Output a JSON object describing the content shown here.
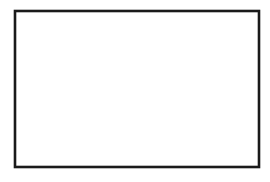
{
  "figure": {
    "kind": "line-drawing",
    "background_color": "#ffffff",
    "line_color": "#262626",
    "frame_color": "#1a1a1a",
    "frame": {
      "x": 15,
      "y": 11,
      "width": 244,
      "height": 156,
      "stroke_width": 2.6
    },
    "canvas": {
      "width": 270,
      "height": 182
    },
    "grain_count": 27,
    "caption": ""
  },
  "grains": [
    {
      "id": "grain-01",
      "label": "",
      "path": "M 16 14 C 30 12 46 13 58 18 C 70 23 74 34 66 44 C 58 54 40 58 28 54 C 20 51 16 44 16 36 Z"
    },
    {
      "id": "grain-02",
      "label": "",
      "path": "M 58 17 C 74 12 92 12 104 17 C 114 21 114 33 106 43 C 98 53 80 58 68 52 C 59 47 55 36 58 17 Z"
    },
    {
      "id": "grain-03",
      "label": "",
      "path": "M 106 13 C 122 12 140 13 150 19 C 158 24 158 37 150 47 C 142 57 124 58 114 52 C 104 46 100 30 106 13 Z"
    },
    {
      "id": "grain-04",
      "label": "",
      "path": "M 152 13 C 166 12 180 16 186 26 C 192 36 188 48 178 54 C 168 60 154 56 150 46 C 146 36 146 22 152 13 Z"
    },
    {
      "id": "grain-05",
      "label": "",
      "path": "M 186 14 C 198 12 206 22 204 36 C 202 50 192 58 184 54 C 176 50 176 34 180 24 C 182 18 184 15 186 14 Z"
    },
    {
      "id": "grain-06",
      "label": "",
      "path": "M 206 13 C 224 12 242 14 252 20 C 258 25 258 38 250 46 C 240 55 222 56 212 50 C 204 44 202 26 206 13 Z"
    },
    {
      "id": "grain-07",
      "label": "",
      "path": "M 16 52 C 28 48 44 50 52 58 C 60 66 58 80 48 88 C 38 96 22 96 16 90 Z"
    },
    {
      "id": "grain-08",
      "label": "",
      "path": "M 54 56 C 74 46 100 48 112 58 C 124 68 122 90 110 104 C 98 118 72 122 58 112 C 46 103 44 70 54 56 Z"
    },
    {
      "id": "grain-09",
      "label": "",
      "path": "M 114 54 C 138 44 166 48 178 62 C 190 76 188 104 174 118 C 160 132 130 134 118 120 C 106 106 104 66 114 54 Z"
    },
    {
      "id": "grain-10",
      "label": "",
      "path": "M 182 54 C 202 46 226 48 238 58 C 250 68 248 88 236 98 C 224 108 200 110 188 100 C 176 90 174 62 182 54 Z"
    },
    {
      "id": "grain-11",
      "label": "",
      "path": "M 240 50 C 250 48 258 54 258 64 C 258 74 250 82 242 80 C 234 78 232 60 240 50 Z"
    },
    {
      "id": "grain-12",
      "label": "",
      "path": "M 16 92 C 28 90 42 94 48 102 C 54 110 50 122 40 128 C 30 134 18 132 16 126 Z"
    },
    {
      "id": "grain-13",
      "label": "",
      "path": "M 50 92 C 62 88 76 92 82 102 C 88 112 84 126 74 132 C 64 138 52 134 48 124 C 44 114 44 98 50 92 Z"
    },
    {
      "id": "grain-14",
      "label": "",
      "path": "M 62 116 C 74 112 88 118 92 128 C 96 138 90 152 78 156 C 66 160 56 154 54 144 C 52 134 54 120 62 116 Z"
    },
    {
      "id": "grain-15",
      "label": "",
      "path": "M 86 118 C 104 110 126 114 136 126 C 146 138 142 156 128 164 C 114 172 92 168 84 156 C 76 144 78 124 86 118 Z"
    },
    {
      "id": "grain-16",
      "label": "",
      "path": "M 140 124 C 152 118 166 122 172 132 C 178 142 174 158 162 164 C 150 170 138 164 134 154 C 130 144 132 130 140 124 Z"
    },
    {
      "id": "grain-17",
      "label": "",
      "path": "M 176 120 C 194 110 216 114 226 126 C 236 138 232 158 218 166 C 204 174 182 168 174 156 C 166 144 168 126 176 120 Z"
    },
    {
      "id": "grain-18",
      "label": "",
      "path": "M 230 104 C 244 98 256 104 258 116 C 260 128 252 140 240 142 C 228 144 220 134 222 122 C 224 112 226 106 230 104 Z"
    },
    {
      "id": "grain-19",
      "label": "",
      "path": "M 234 144 C 246 140 256 146 258 156 C 260 164 252 168 242 166 C 232 164 228 150 234 144 Z"
    }
  ],
  "boundaries": [
    {
      "id": "boundary-01",
      "path": "M 15 38 C 26 34 38 20 50 14"
    },
    {
      "id": "boundary-02",
      "path": "M 50 14 C 62 22 66 34 62 46 C 58 56 50 60 40 56"
    },
    {
      "id": "boundary-03",
      "path": "M 40 56 C 30 52 22 48 15 50"
    },
    {
      "id": "boundary-04",
      "path": "M 62 46 C 74 44 88 48 96 42 C 104 36 106 24 102 12"
    },
    {
      "id": "boundary-05",
      "path": "M 96 42 C 100 52 98 60 92 66"
    },
    {
      "id": "boundary-06",
      "path": "M 148 12 C 142 24 140 36 146 46 C 152 56 164 58 176 52"
    },
    {
      "id": "boundary-07",
      "path": "M 176 52 C 186 46 190 34 186 22 C 184 16 180 12 176 12"
    },
    {
      "id": "boundary-08",
      "path": "M 200 12 C 196 26 198 42 206 50 C 214 58 230 58 240 52"
    },
    {
      "id": "boundary-09",
      "path": "M 240 52 C 248 46 252 34 250 24 C 249 18 248 14 246 12"
    },
    {
      "id": "boundary-10",
      "path": "M 15 88 C 28 84 44 82 54 74 C 62 68 66 58 64 48"
    },
    {
      "id": "boundary-11",
      "path": "M 64 48 C 78 44 96 46 106 54 C 116 62 118 80 112 96"
    },
    {
      "id": "boundary-12",
      "path": "M 112 96 C 104 106 90 112 76 110 C 64 108 56 98 54 86"
    },
    {
      "id": "boundary-13",
      "path": "M 54 86 C 48 92 40 94 15 96"
    },
    {
      "id": "boundary-14",
      "path": "M 114 54 C 130 46 154 48 166 58 C 178 68 180 92 174 110"
    },
    {
      "id": "boundary-15",
      "path": "M 174 110 C 166 122 150 128 136 124 C 124 120 118 108 118 94"
    },
    {
      "id": "boundary-16",
      "path": "M 118 94 C 116 76 112 62 114 54"
    },
    {
      "id": "boundary-17",
      "path": "M 180 56 C 196 48 220 50 232 60 C 242 68 244 86 238 98"
    },
    {
      "id": "boundary-18",
      "path": "M 238 98 C 230 106 216 108 204 102 C 194 97 188 86 188 74"
    },
    {
      "id": "boundary-19",
      "path": "M 188 74 C 186 64 180 58 180 56"
    },
    {
      "id": "boundary-20",
      "path": "M 238 98 C 246 96 254 98 259 100"
    },
    {
      "id": "boundary-21",
      "path": "M 204 102 C 200 112 198 124 202 134"
    },
    {
      "id": "boundary-22",
      "path": "M 202 134 C 208 146 220 154 232 156 C 242 158 252 156 259 152"
    },
    {
      "id": "boundary-23",
      "path": "M 202 134 C 192 142 186 152 184 166"
    },
    {
      "id": "boundary-24",
      "path": "M 188 74 C 178 80 170 92 168 104"
    },
    {
      "id": "boundary-25",
      "path": "M 168 104 C 160 112 150 116 140 118"
    },
    {
      "id": "boundary-26",
      "path": "M 140 118 C 130 126 126 140 128 154 C 129 160 130 164 132 167"
    },
    {
      "id": "boundary-27",
      "path": "M 140 118 C 146 130 150 144 150 160 C 150 164 150 166 150 167"
    },
    {
      "id": "boundary-28",
      "path": "M 118 94 C 110 104 100 112 88 116"
    },
    {
      "id": "boundary-29",
      "path": "M 88 116 C 80 124 76 138 78 152 C 79 160 80 165 82 167"
    },
    {
      "id": "boundary-30",
      "path": "M 88 116 C 96 124 104 136 110 150 C 114 158 116 164 116 167"
    },
    {
      "id": "boundary-31",
      "path": "M 54 86 C 56 98 60 108 68 116"
    },
    {
      "id": "boundary-32",
      "path": "M 68 116 C 76 120 84 118 88 116"
    },
    {
      "id": "boundary-33",
      "path": "M 68 116 C 60 122 54 132 52 144 C 51 154 52 162 54 167"
    },
    {
      "id": "boundary-34",
      "path": "M 68 116 C 58 118 46 120 36 126"
    },
    {
      "id": "boundary-35",
      "path": "M 36 126 C 28 132 24 142 24 152 C 24 160 26 165 28 167"
    },
    {
      "id": "boundary-36",
      "path": "M 36 126 C 30 120 22 116 15 114"
    },
    {
      "id": "boundary-37",
      "path": "M 36 126 C 42 134 44 146 42 156 C 41 162 40 165 39 167"
    },
    {
      "id": "boundary-38",
      "path": "M 168 104 C 174 114 180 126 184 140 C 186 150 186 160 184 166"
    },
    {
      "id": "boundary-39",
      "path": "M 259 126 C 250 124 240 126 232 132 C 226 137 222 144 220 152"
    },
    {
      "id": "boundary-40",
      "path": "M 232 156 C 230 160 228 164 227 167"
    },
    {
      "id": "boundary-41",
      "path": "M 92 66 C 98 62 106 58 114 54"
    },
    {
      "id": "boundary-42",
      "path": "M 92 66 C 84 62 74 58 64 48"
    }
  ],
  "labels": {
    "none": ""
  }
}
